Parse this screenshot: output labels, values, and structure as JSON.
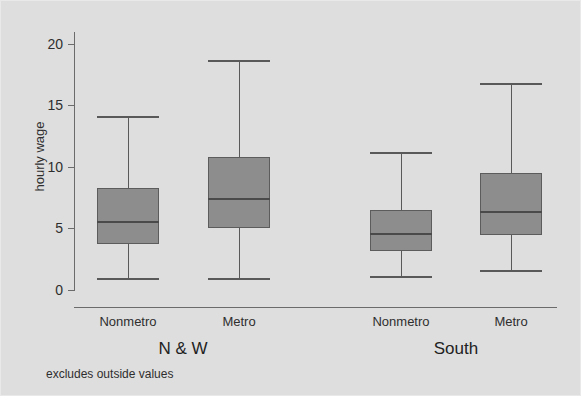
{
  "figure": {
    "background_color": "#dedede",
    "box_fill_color": "#8d8d8d",
    "line_color": "#595959",
    "footnote": "excludes outside values"
  },
  "axes": {
    "ylabel": "hourly wage",
    "yticks": [
      {
        "value": 20,
        "label": "20"
      },
      {
        "value": 15,
        "label": "15"
      },
      {
        "value": 10,
        "label": "10"
      },
      {
        "value": 5,
        "label": "5"
      },
      {
        "value": 0,
        "label": "0"
      }
    ],
    "ylim": [
      0,
      20.9
    ],
    "xlabel": ""
  },
  "groups": [
    {
      "label": "N & W",
      "center_px": 182
    },
    {
      "label": "South",
      "center_px": 455
    }
  ],
  "categories": [
    {
      "label": "Nonmetro",
      "center_px": 127
    },
    {
      "label": "Metro",
      "center_px": 238
    },
    {
      "label": "Nonmetro",
      "center_px": 400
    },
    {
      "label": "Metro",
      "center_px": 510
    }
  ],
  "chart_data": {
    "type": "box",
    "title": "",
    "xlabel": "",
    "ylabel": "hourly wage",
    "ylim": [
      0,
      20.9
    ],
    "grid": false,
    "legend": null,
    "annotations": [
      "excludes outside values"
    ],
    "group_labels": [
      "N & W",
      "South"
    ],
    "categories": [
      "Nonmetro",
      "Metro",
      "Nonmetro",
      "Metro"
    ],
    "boxes": [
      {
        "group": "N & W",
        "category": "Nonmetro",
        "whisker_low": 1.0,
        "q1": 3.7,
        "median": 5.6,
        "q3": 8.3,
        "whisker_high": 14.1,
        "center_px": 127,
        "box_width_px": 62
      },
      {
        "group": "N & W",
        "category": "Metro",
        "whisker_low": 1.0,
        "q1": 5.0,
        "median": 7.5,
        "q3": 10.8,
        "whisker_high": 18.7,
        "center_px": 238,
        "box_width_px": 62
      },
      {
        "group": "South",
        "category": "Nonmetro",
        "whisker_low": 1.1,
        "q1": 3.2,
        "median": 4.6,
        "q3": 6.5,
        "whisker_high": 11.2,
        "center_px": 400,
        "box_width_px": 62
      },
      {
        "group": "South",
        "category": "Metro",
        "whisker_low": 1.6,
        "q1": 4.5,
        "median": 6.4,
        "q3": 9.5,
        "whisker_high": 16.8,
        "center_px": 510,
        "box_width_px": 62
      }
    ]
  }
}
